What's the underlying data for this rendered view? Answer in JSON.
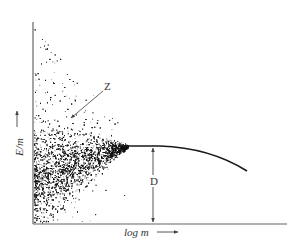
{
  "figure": {
    "y_axis_label": "E/m",
    "x_axis_label": "log m",
    "annotations": [
      {
        "id": "Z",
        "label": "Z"
      },
      {
        "id": "D",
        "label": "D"
      }
    ],
    "colors": {
      "axis": "#555555",
      "scatter": "#111111",
      "curve": "#1a1a1a",
      "background": "#ffffff"
    }
  },
  "chart_data": {
    "type": "scatter",
    "title": "",
    "xlabel": "log m",
    "ylabel": "E/m",
    "grid": false,
    "legend": null,
    "curve": {
      "points_px": [
        [
          125,
          146
        ],
        [
          160,
          146
        ],
        [
          185,
          148
        ],
        [
          205,
          151
        ],
        [
          222,
          157
        ],
        [
          236,
          164
        ],
        [
          247,
          171
        ]
      ]
    },
    "annotations": [
      {
        "text": "Z",
        "meaning": "arrow pointing to the spread/funnel region of scatter"
      },
      {
        "text": "D",
        "meaning": "double-headed vertical arrow from x-axis to curve plateau"
      }
    ]
  }
}
